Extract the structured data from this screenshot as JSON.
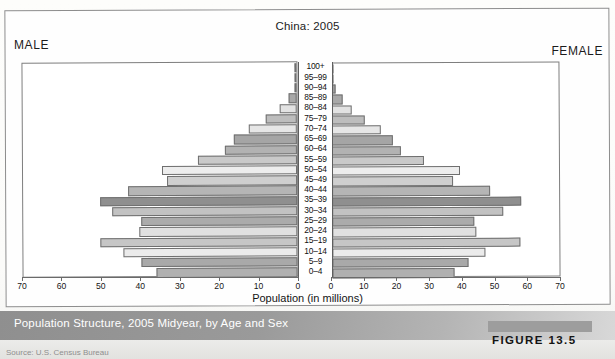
{
  "figure": {
    "title": "China: 2005",
    "male_label": "MALE",
    "female_label": "FEMALE",
    "caption": "Population Structure, 2005 Midyear, by Age and Sex",
    "figure_number": "FIGURE 13.5",
    "source": "Source: U.S. Census Bureau"
  },
  "chart_data": {
    "type": "bar",
    "subtype": "population-pyramid",
    "title": "China: 2005",
    "xlabel": "Population (in millions)",
    "ylabel": "",
    "grid": false,
    "legend_position": "none",
    "xlim": [
      0,
      70
    ],
    "xticks": [
      0,
      10,
      20,
      30,
      40,
      50,
      60,
      70
    ],
    "xtick_labels": [
      "0",
      "10",
      "20",
      "30",
      "40",
      "50",
      "60",
      "70"
    ],
    "left_axis_direction": "reversed",
    "categories": [
      "100+",
      "95-99",
      "90-94",
      "85-89",
      "80-84",
      "75-79",
      "70-74",
      "65-69",
      "60-64",
      "55-59",
      "50-54",
      "45-49",
      "40-44",
      "35-39",
      "30-34",
      "25-29",
      "20-24",
      "15-19",
      "10-14",
      "5-9",
      "0-4"
    ],
    "series": [
      {
        "name": "MALE",
        "side": "left",
        "values": [
          0.05,
          0.2,
          0.8,
          2.5,
          5.5,
          10.0,
          15.5,
          20.0,
          23.0,
          31.5,
          43.0,
          41.5,
          54.0,
          63.0,
          59.0,
          50.0,
          50.5,
          63.0,
          55.5,
          50.0,
          45.0
        ]
      },
      {
        "name": "FEMALE",
        "side": "right",
        "values": [
          0.05,
          0.3,
          1.2,
          3.5,
          6.5,
          10.5,
          15.5,
          19.5,
          22.0,
          29.5,
          41.0,
          38.5,
          50.5,
          60.5,
          54.5,
          45.5,
          46.0,
          60.0,
          49.0,
          43.5,
          39.0
        ]
      }
    ],
    "bar_shades": [
      "#b9b9b9",
      "#d9d9d9",
      "#9d9d9d",
      "#a8a8a8",
      "#e2e2e2",
      "#bdbdbd",
      "#e6e6e6",
      "#a5a5a5",
      "#b2b2b2",
      "#c9c9c9",
      "#ededed",
      "#cfcfcf",
      "#b5b5b5",
      "#8f8f8f",
      "#c2c2c2",
      "#ababab",
      "#e0e0e0",
      "#c6c6c6",
      "#ebebeb",
      "#a9a9a9",
      "#b0b0b0"
    ]
  },
  "colors": {
    "axis": "#6a6a6a",
    "bar_outline": "#6f6f6f",
    "caption_text": "#ffffff",
    "page_background": "#ffffff"
  }
}
